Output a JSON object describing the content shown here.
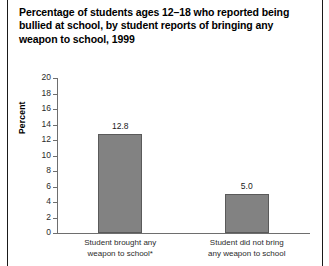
{
  "chart_data": {
    "type": "bar",
    "title": "Percentage of students ages 12–18 who reported being bullied at school, by student reports of bringing any weapon to school, 1999",
    "xlabel": "",
    "ylabel": "Percent",
    "categories": [
      "Student brought any\nweapon to school*",
      "Student did not bring\nany weapon to school"
    ],
    "values": [
      12.8,
      5.0
    ],
    "value_labels": [
      "12.8",
      "5.0"
    ],
    "ylim": [
      0,
      20
    ],
    "yticks": [
      0,
      2,
      4,
      6,
      8,
      10,
      12,
      14,
      16,
      18,
      20
    ],
    "ytick_labels": [
      "0",
      "2",
      "4",
      "6",
      "8",
      "10",
      "12",
      "14",
      "16",
      "18",
      "20"
    ],
    "grid": false,
    "legend": false,
    "bar_color": "#828282",
    "bar_edge_color": "#5a5a5a",
    "axis_color": "#6e6e6e",
    "text_color": "#1a1a1a"
  }
}
